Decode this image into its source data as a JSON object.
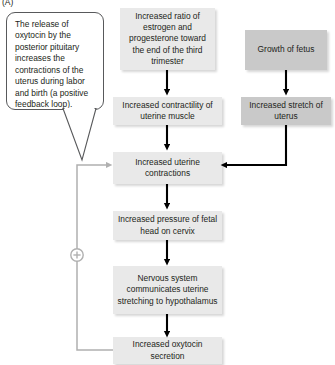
{
  "figure": {
    "panel_label": "(A)",
    "type": "flowchart",
    "topic": "Positive feedback loop controlling uterine contractions during labor and birth"
  },
  "callout": {
    "name": "oxytocin-explanation-callout",
    "text": "The release of oxytocin by the posterior pituitary increases the contractions of the uterus during labor and birth (a positive feedback loop).",
    "border_color": "#58595b",
    "fill_color": "#ffffff"
  },
  "colors": {
    "box_light": "#e9e9e9",
    "box_dark": "#c9c9c9",
    "arrow_black": "#000000",
    "arrow_gray": "#b0b0b0",
    "text": "#231f20"
  },
  "nodes": [
    {
      "id": "estrogen-ratio",
      "label": "Increased ratio of estrogen and progesterone toward the end of the third trimester",
      "shade": "light"
    },
    {
      "id": "growth-of-fetus",
      "label": "Growth of fetus",
      "shade": "dark"
    },
    {
      "id": "uterine-contractility",
      "label": "Increased contractility of uterine muscle",
      "shade": "light"
    },
    {
      "id": "uterine-stretch",
      "label": "Increased stretch of uterus",
      "shade": "dark"
    },
    {
      "id": "uterine-contractions",
      "label": "Increased uterine contractions",
      "shade": "light"
    },
    {
      "id": "fetal-head-pressure",
      "label": "Increased pressure of fetal head on cervix",
      "shade": "light"
    },
    {
      "id": "nervous-system",
      "label": "Nervous system communicates uterine stretching to hypothalamus",
      "shade": "light"
    },
    {
      "id": "oxytocin-secretion",
      "label": "Increased oxytocin secretion",
      "shade": "light"
    }
  ],
  "feedback_loop": {
    "symbol": "+",
    "symbol_name": "positive-feedback-plus-symbol",
    "from": "oxytocin-secretion",
    "to": "uterine-contractions",
    "color": "#b0b0b0"
  },
  "edges": [
    {
      "from": "estrogen-ratio",
      "to": "uterine-contractility",
      "style": "black-arrow"
    },
    {
      "from": "growth-of-fetus",
      "to": "uterine-stretch",
      "style": "black-arrow"
    },
    {
      "from": "uterine-contractility",
      "to": "uterine-contractions",
      "style": "black-arrow"
    },
    {
      "from": "uterine-stretch",
      "to": "uterine-contractions",
      "style": "black-elbow-arrow"
    },
    {
      "from": "uterine-contractions",
      "to": "fetal-head-pressure",
      "style": "black-arrow"
    },
    {
      "from": "fetal-head-pressure",
      "to": "nervous-system",
      "style": "black-arrow"
    },
    {
      "from": "nervous-system",
      "to": "oxytocin-secretion",
      "style": "black-arrow"
    },
    {
      "from": "oxytocin-secretion",
      "to": "uterine-contractions",
      "style": "gray-feedback-arrow"
    }
  ]
}
